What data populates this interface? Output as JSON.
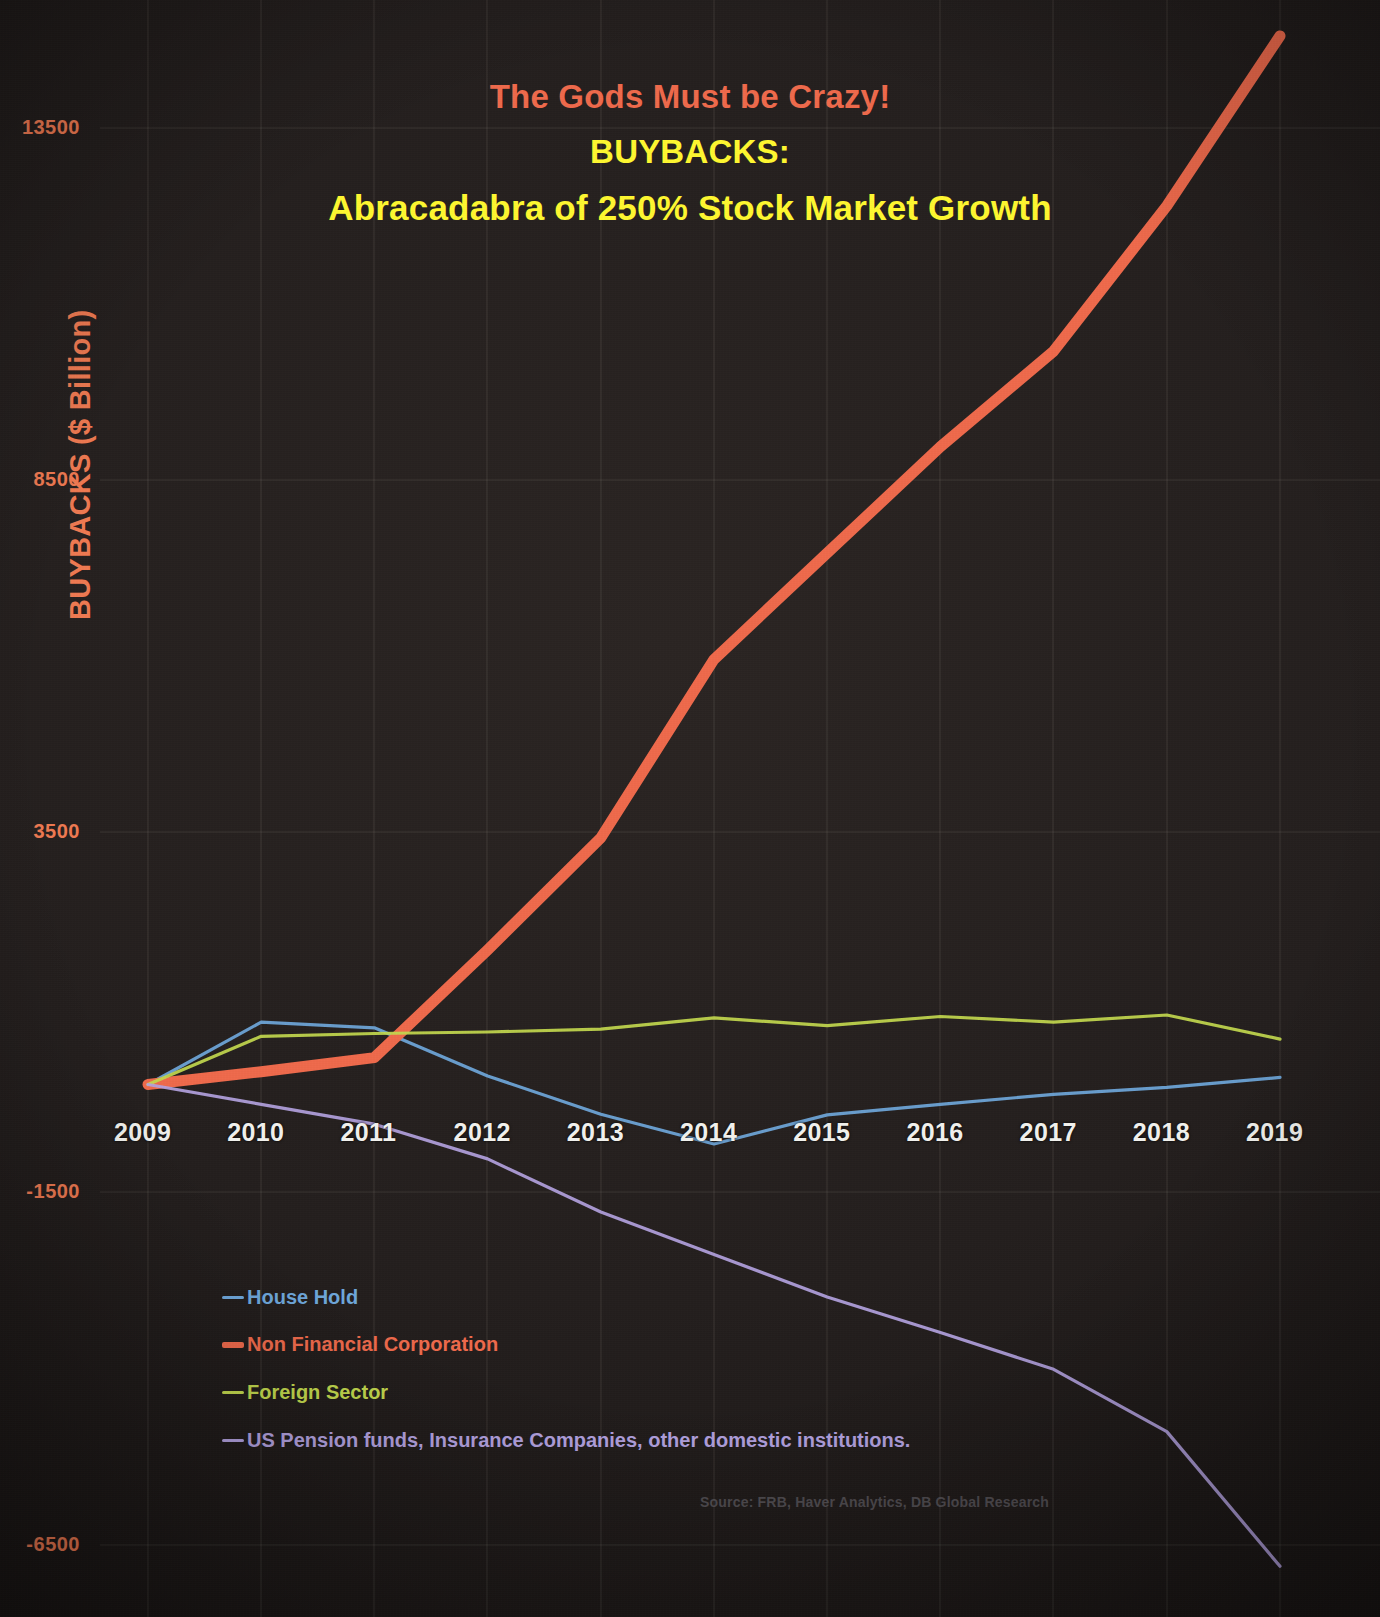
{
  "title": {
    "line1": "The Gods Must be Crazy!",
    "line2": "BUYBACKS:",
    "line3": "Abracadabra of 250% Stock Market Growth",
    "color_line1": "#ef6a4c",
    "color_line2": "#fff830",
    "color_line3": "#fff830"
  },
  "axis": {
    "y_title": "BUYBACKS ($ Billion)",
    "y_title_color": "#ef7a52",
    "y_ticks": [
      "13500",
      "8500",
      "3500",
      "-1500",
      "-6500"
    ],
    "x_ticks": [
      "2009",
      "2010",
      "2011",
      "2012",
      "2013",
      "2014",
      "2015",
      "2016",
      "2017",
      "2018",
      "2019"
    ]
  },
  "legend": [
    {
      "label": "House Hold",
      "color": "#6fa8dc"
    },
    {
      "label": "Non Financial Corporation",
      "color": "#ef6a4c"
    },
    {
      "label": "Foreign Sector",
      "color": "#c3d94e"
    },
    {
      "label": "US Pension funds, Insurance Companies, other domestic institutions.",
      "color": "#b3a2e0"
    }
  ],
  "source": "Source: FRB, Haver Analytics, DB Global Research",
  "chart_data": {
    "type": "line",
    "title": "The Gods Must be Crazy! BUYBACKS: Abracadabra of 250% Stock Market Growth",
    "xlabel": "",
    "ylabel": "BUYBACKS ($ Billion)",
    "x": [
      2009,
      2010,
      2011,
      2012,
      2013,
      2014,
      2015,
      2016,
      2017,
      2018,
      2019
    ],
    "categories": [
      "2009",
      "2010",
      "2011",
      "2012",
      "2013",
      "2014",
      "2015",
      "2016",
      "2017",
      "2018",
      "2019"
    ],
    "ylim": [
      -7000,
      14900
    ],
    "yticks": [
      13500,
      8500,
      3500,
      -1500,
      -6500
    ],
    "grid": true,
    "legend_position": "bottom-left",
    "series": [
      {
        "name": "House Hold",
        "color": "#6fa8dc",
        "values": [
          0,
          880,
          800,
          120,
          -420,
          -840,
          -430,
          -280,
          -140,
          -40,
          100
        ]
      },
      {
        "name": "Non Financial Corporation",
        "color": "#ef6a4c",
        "values": [
          0,
          180,
          380,
          1900,
          3480,
          6000,
          7500,
          9000,
          10350,
          12400,
          14800
        ]
      },
      {
        "name": "Foreign Sector",
        "color": "#c3d94e",
        "values": [
          0,
          680,
          720,
          740,
          780,
          940,
          830,
          960,
          880,
          980,
          640
        ]
      },
      {
        "name": "US Pension funds, Insurance Companies, other domestic institutions.",
        "color": "#b3a2e0",
        "values": [
          0,
          -280,
          -560,
          -1050,
          -1800,
          -2400,
          -3000,
          -3500,
          -4020,
          -4900,
          -6800
        ]
      }
    ]
  },
  "geometry": {
    "plot_left": 148,
    "plot_right": 1280,
    "y_at_13500": 128,
    "y_at_neg6500": 1545,
    "x_label_y": 1118,
    "y_label_x_right": 80,
    "legend_x": 222,
    "legend_rows_y": [
      1286,
      1333,
      1381,
      1429
    ],
    "vgrid_x": [
      148,
      261,
      374,
      487,
      601,
      714,
      827,
      940,
      1053,
      1167,
      1280
    ],
    "hgrid_y": [
      128,
      480,
      832,
      1192,
      1545
    ]
  }
}
